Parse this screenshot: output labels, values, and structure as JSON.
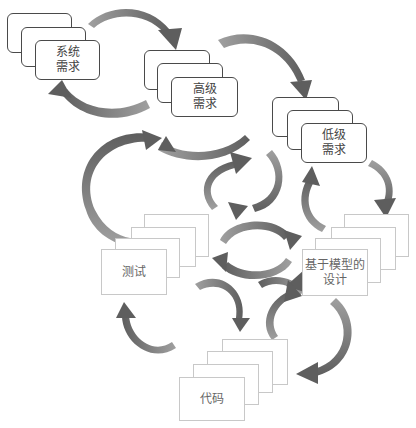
{
  "diagram": {
    "title": "",
    "nodes": [
      {
        "id": "system-req",
        "lines": [
          "系统",
          "需求"
        ],
        "style": "rounded",
        "stack_depth": 3
      },
      {
        "id": "high-req",
        "lines": [
          "高级",
          "需求"
        ],
        "style": "rounded",
        "stack_depth": 3
      },
      {
        "id": "low-req",
        "lines": [
          "低级",
          "需求"
        ],
        "style": "rounded",
        "stack_depth": 3
      },
      {
        "id": "test",
        "lines": [
          "测试"
        ],
        "style": "flat",
        "stack_depth": 4
      },
      {
        "id": "mbd",
        "lines": [
          "基于模型的",
          "设计"
        ],
        "style": "flat",
        "stack_depth": 4
      },
      {
        "id": "code",
        "lines": [
          "代码"
        ],
        "style": "flat",
        "stack_depth": 4
      }
    ],
    "edges": [
      {
        "from": "system-req",
        "to": "high-req"
      },
      {
        "from": "high-req",
        "to": "system-req"
      },
      {
        "from": "high-req",
        "to": "low-req"
      },
      {
        "from": "low-req",
        "to": "high-req"
      },
      {
        "from": "high-req",
        "to": "mbd"
      },
      {
        "from": "mbd",
        "to": "high-req"
      },
      {
        "from": "low-req",
        "to": "mbd"
      },
      {
        "from": "mbd",
        "to": "low-req"
      },
      {
        "from": "test",
        "to": "system-req"
      },
      {
        "from": "mbd",
        "to": "test"
      },
      {
        "from": "test",
        "to": "mbd"
      },
      {
        "from": "test",
        "to": "code"
      },
      {
        "from": "code",
        "to": "test"
      },
      {
        "from": "mbd",
        "to": "code"
      },
      {
        "from": "code",
        "to": "mbd"
      }
    ],
    "colors": {
      "arrow_dark": "#6b6b6b",
      "arrow_light": "#9a9a9a",
      "rounded_border": "#4a4a4a",
      "flat_border": "#c8c8c8"
    }
  }
}
